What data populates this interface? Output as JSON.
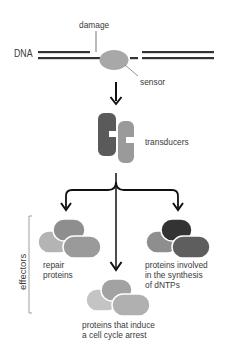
{
  "labels": {
    "dna": "DNA",
    "damage": "damage",
    "sensor": "sensor",
    "transducers": "transducers",
    "effectors": "effectors",
    "repair_line1": "repair",
    "repair_line2": "proteins",
    "dntp_line1": "proteins involved",
    "dntp_line2": "in the synthesis",
    "dntp_line3": "of dNTPs",
    "arrest_line1": "proteins that induce",
    "arrest_line2": "a cell cycle arrest"
  },
  "colors": {
    "dna_strand": "#333333",
    "sensor": "#a8a8a8",
    "transducer_dark": "#5a5a5a",
    "transducer_light": "#9a9a9a",
    "arrow": "#111111",
    "blob_light": "#b4b4b4",
    "blob_mid": "#8e8e8e",
    "blob_dark": "#3a3a3a"
  }
}
